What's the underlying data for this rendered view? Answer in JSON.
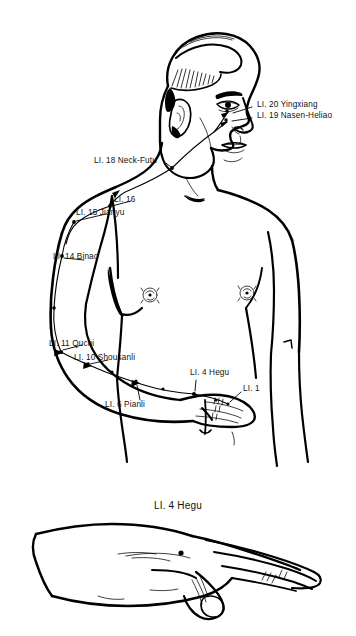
{
  "figure": {
    "type": "anatomical-line-drawing",
    "background_color": "#ffffff",
    "ink_color": "#000000"
  },
  "panels": {
    "upper": {
      "name": "male-torso-head-arm",
      "caption": ""
    },
    "lower": {
      "name": "hand-dorsum-detail",
      "caption": "LI. 4 Hegu"
    }
  },
  "labels": [
    {
      "id": "li20",
      "text": "LI. 20 Yingxiang",
      "x": 257,
      "y": 104
    },
    {
      "id": "li19",
      "text": "LI. 19 Nasen-Heliao",
      "x": 257,
      "y": 115
    },
    {
      "id": "li18",
      "text": "LI. 18 Neck-Futu",
      "x": 94,
      "y": 160
    },
    {
      "id": "li16",
      "text": "LI. 16",
      "x": 114,
      "y": 199
    },
    {
      "id": "li15",
      "text": "LI. 15 Jianyu",
      "x": 76,
      "y": 212
    },
    {
      "id": "li14",
      "text": "LI. 14 Binao",
      "x": 53,
      "y": 256
    },
    {
      "id": "li11",
      "text": "LI. 11 Quchi",
      "x": 49,
      "y": 343
    },
    {
      "id": "li10",
      "text": "LI. 10 Shousanli",
      "x": 74,
      "y": 357
    },
    {
      "id": "li4",
      "text": "LI. 4 Hegu",
      "x": 190,
      "y": 372
    },
    {
      "id": "li1",
      "text": "LI. 1",
      "x": 243,
      "y": 388
    },
    {
      "id": "li6",
      "text": "LI. 6 Pianli",
      "x": 105,
      "y": 404
    }
  ],
  "points": [
    {
      "id": "li20-pt",
      "label": "LI. 20 Yingxiang",
      "x": 227,
      "y": 111
    },
    {
      "id": "li19-pt",
      "label": "LI. 19 Nasen-Heliao",
      "x": 226,
      "y": 120
    },
    {
      "id": "li18-pt",
      "label": "LI. 18 Neck-Futu",
      "x": 172,
      "y": 168
    },
    {
      "id": "li16-pt",
      "label": "LI. 16",
      "x": 110,
      "y": 206
    },
    {
      "id": "li15-pt",
      "label": "LI. 15 Jianyu",
      "x": 74,
      "y": 222
    },
    {
      "id": "li14-pt",
      "label": "LI. 14 Binao",
      "x": 48,
      "y": 268
    },
    {
      "id": "li11-pt",
      "label": "LI. 11 Quchi",
      "x": 61,
      "y": 352
    },
    {
      "id": "li10-pt",
      "label": "LI. 10 Shousanli",
      "x": 88,
      "y": 364
    },
    {
      "id": "li6-pt",
      "label": "LI. 6 Pianli",
      "x": 136,
      "y": 381
    },
    {
      "id": "li4-pt",
      "label": "LI. 4 Hegu",
      "x": 194,
      "y": 394
    },
    {
      "id": "hand-li4-pt",
      "label": "LI. 4 Hegu (hand detail)",
      "x": 181,
      "y": 553
    }
  ],
  "meridian": {
    "name": "large-intestine-channel",
    "description": "Channel runs from index finger along radial forearm, up the arm, across shoulder and neck to the nose."
  }
}
